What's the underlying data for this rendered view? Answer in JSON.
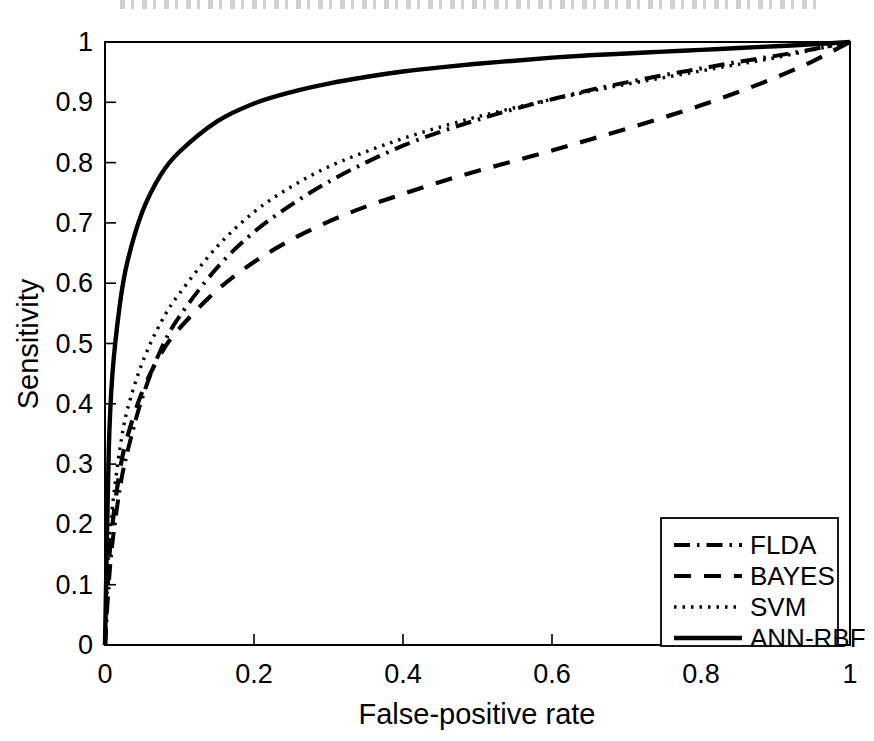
{
  "chart_data": {
    "type": "line",
    "title": "",
    "xlabel": "False-positive rate",
    "ylabel": "Sensitivity",
    "xlim": [
      0,
      1
    ],
    "ylim": [
      0,
      1
    ],
    "grid": false,
    "legend_position": "lower-right",
    "xticks": [
      "0",
      "0.2",
      "0.4",
      "0.6",
      "0.8",
      "1"
    ],
    "xtick_values": [
      0,
      0.2,
      0.4,
      0.6,
      0.8,
      1
    ],
    "yticks": [
      "0",
      "0.1",
      "0.2",
      "0.3",
      "0.4",
      "0.5",
      "0.6",
      "0.7",
      "0.8",
      "0.9",
      "1"
    ],
    "ytick_values": [
      0,
      0.1,
      0.2,
      0.3,
      0.4,
      0.5,
      0.6,
      0.7,
      0.8,
      0.9,
      1
    ],
    "x": [
      0,
      0.005,
      0.01,
      0.02,
      0.03,
      0.05,
      0.075,
      0.1,
      0.15,
      0.2,
      0.25,
      0.3,
      0.35,
      0.4,
      0.45,
      0.5,
      0.55,
      0.6,
      0.65,
      0.7,
      0.75,
      0.8,
      0.85,
      0.9,
      0.95,
      1
    ],
    "series": [
      {
        "name": "FLDA",
        "linestyle": "dash-dot",
        "color": "#000000",
        "values": [
          0,
          0.1,
          0.17,
          0.26,
          0.32,
          0.41,
          0.49,
          0.545,
          0.625,
          0.685,
          0.73,
          0.768,
          0.8,
          0.828,
          0.851,
          0.871,
          0.889,
          0.905,
          0.92,
          0.933,
          0.945,
          0.956,
          0.967,
          0.977,
          0.988,
          1.0
        ]
      },
      {
        "name": "BAYES",
        "linestyle": "dashed",
        "color": "#000000",
        "values": [
          0,
          0.13,
          0.2,
          0.29,
          0.345,
          0.42,
          0.483,
          0.525,
          0.588,
          0.635,
          0.672,
          0.702,
          0.727,
          0.748,
          0.768,
          0.786,
          0.803,
          0.82,
          0.838,
          0.856,
          0.875,
          0.895,
          0.917,
          0.941,
          0.968,
          1.0
        ]
      },
      {
        "name": "SVM",
        "linestyle": "dotted",
        "color": "#000000",
        "values": [
          0,
          0.15,
          0.23,
          0.325,
          0.39,
          0.468,
          0.535,
          0.583,
          0.66,
          0.718,
          0.76,
          0.793,
          0.818,
          0.84,
          0.859,
          0.876,
          0.891,
          0.905,
          0.918,
          0.93,
          0.941,
          0.952,
          0.963,
          0.974,
          0.987,
          1.0
        ]
      },
      {
        "name": "ANN-RBF",
        "linestyle": "solid",
        "color": "#000000",
        "values": [
          0,
          0.32,
          0.45,
          0.565,
          0.635,
          0.718,
          0.78,
          0.818,
          0.868,
          0.898,
          0.917,
          0.931,
          0.942,
          0.951,
          0.958,
          0.964,
          0.969,
          0.974,
          0.978,
          0.981,
          0.984,
          0.987,
          0.99,
          0.993,
          0.996,
          1.0
        ]
      }
    ],
    "legend_entries": [
      {
        "label": "FLDA",
        "linestyle": "dash-dot"
      },
      {
        "label": "BAYES",
        "linestyle": "dashed"
      },
      {
        "label": "SVM",
        "linestyle": "dotted"
      },
      {
        "label": "ANN-RBF",
        "linestyle": "solid"
      }
    ]
  }
}
